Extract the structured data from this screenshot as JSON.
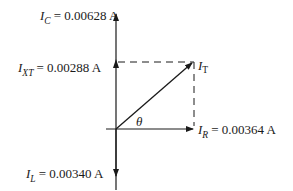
{
  "diagram": {
    "type": "phasor",
    "labels": {
      "ic": {
        "symbol": "I",
        "sub": "C",
        "value": "= 0.00628  A"
      },
      "ixt": {
        "symbol": "I",
        "sub": "XT",
        "value": "= 0.00288  A"
      },
      "it": {
        "symbol": "I",
        "sub": "T"
      },
      "ir": {
        "symbol": "I",
        "sub": "R",
        "value": "= 0.00364  A"
      },
      "il": {
        "symbol": "I",
        "sub": "L",
        "value": "= 0.00340  A"
      },
      "theta": "θ"
    },
    "values": {
      "I_C": 0.00628,
      "I_XT": 0.00288,
      "I_R": 0.00364,
      "I_L": 0.0034,
      "unit": "A"
    },
    "color": "#1a1a1a"
  }
}
